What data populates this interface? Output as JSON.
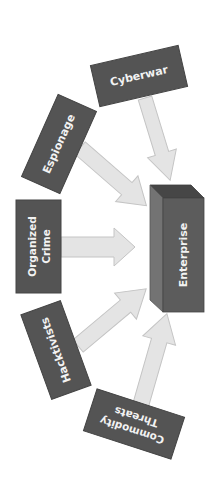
{
  "diagram": {
    "background": "#ffffff",
    "colors": {
      "box_fill": "#545454",
      "arrow_fill": "#e4e4e4",
      "arrow_stroke": "#c4c4c4",
      "text": "#f2f2f2",
      "enterprise_front": "#5c5c5c",
      "enterprise_side": "#737373",
      "enterprise_top": "#464646"
    },
    "target": {
      "label": "Enterprise"
    },
    "sources": [
      {
        "id": "cyberwar",
        "line1": "Cyberwar",
        "line2": ""
      },
      {
        "id": "espionage",
        "line1": "Espionage",
        "line2": ""
      },
      {
        "id": "organized-crime",
        "line1": "Organized",
        "line2": "Crime"
      },
      {
        "id": "hacktivists",
        "line1": "Hacktivists",
        "line2": ""
      },
      {
        "id": "commodity-threats",
        "line1": "Commodity",
        "line2": "Threats"
      }
    ]
  }
}
